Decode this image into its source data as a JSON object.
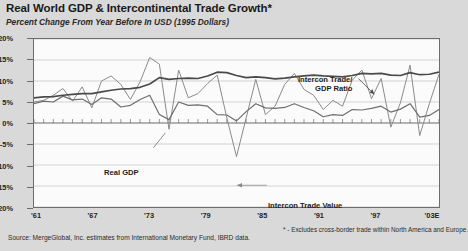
{
  "title": "Real World GDP & Intercontinental Trade Growth*",
  "subtitle": "Percent Change From Year Before In USD (1995 Dollars)",
  "source": "Source:  MergeGlobal, Inc. estimates from International Monetary Fund, IBRD data.",
  "footnote": "* - Excludes cross-border trade within North America and Europe.",
  "annotations": {
    "ratio_line1": "Intercon Trade/",
    "ratio_line2": "GDP Ratio",
    "real_gdp": "Real GDP",
    "trade_value": "Intercon Trade Value"
  },
  "colors": {
    "plot_background": "#fbfbfb",
    "page_background": "#d9d9d9",
    "frame": "#6d6d6d",
    "gridline": "#c9c9c9",
    "zero_line": "#6d6d6d",
    "ratio_series": "#4a4a4a",
    "gdp_series": "#6f6f6f",
    "value_series": "#8a8a8a"
  },
  "chart_data": {
    "type": "line",
    "title": "Real World GDP & Intercontinental Trade Growth*",
    "subtitle": "Percent Change From Year Before In USD (1995 Dollars)",
    "xlabel": "",
    "ylabel": "Percent Change From Year Before In USD (1995 Dollars)",
    "ylim": [
      -20,
      20
    ],
    "yticks": [
      20,
      15,
      10,
      5,
      0,
      -5,
      -10,
      -15,
      -20
    ],
    "ytick_labels": [
      "20%",
      "15%",
      "10%",
      "5%",
      "0%",
      "-5%",
      "-10%",
      "-15%",
      "-20%"
    ],
    "xlim": [
      1961,
      2003
    ],
    "xticks": [
      1961,
      1967,
      1973,
      1979,
      1985,
      1991,
      1997,
      2003
    ],
    "xtick_labels": [
      "'61",
      "'67",
      "'73",
      "'79",
      "'85",
      "'91",
      "'97",
      "'03E"
    ],
    "grid": true,
    "minor_xticks": "annual",
    "legend": "in-plot annotations",
    "x": [
      1961,
      1962,
      1963,
      1964,
      1965,
      1966,
      1967,
      1968,
      1969,
      1970,
      1971,
      1972,
      1973,
      1974,
      1975,
      1976,
      1977,
      1978,
      1979,
      1980,
      1981,
      1982,
      1983,
      1984,
      1985,
      1986,
      1987,
      1988,
      1989,
      1990,
      1991,
      1992,
      1993,
      1994,
      1995,
      1996,
      1997,
      1998,
      1999,
      2000,
      2001,
      2002,
      2003
    ],
    "series": [
      {
        "name": "Intercon Trade/GDP Ratio",
        "units": "percent",
        "values": [
          6.0,
          6.2,
          6.3,
          6.6,
          6.8,
          7.0,
          7.0,
          7.4,
          7.8,
          8.1,
          8.2,
          8.5,
          9.3,
          10.8,
          10.4,
          10.6,
          10.7,
          10.6,
          11.2,
          12.1,
          12.0,
          11.3,
          10.8,
          11.0,
          10.8,
          10.5,
          10.7,
          11.0,
          11.2,
          11.4,
          11.2,
          11.1,
          11.0,
          11.3,
          11.8,
          11.7,
          11.8,
          11.4,
          11.3,
          12.0,
          11.5,
          11.6,
          12.1
        ]
      },
      {
        "name": "Real GDP",
        "units": "percent",
        "values": [
          4.6,
          5.2,
          5.0,
          6.4,
          5.5,
          5.7,
          4.4,
          6.0,
          5.7,
          3.8,
          4.2,
          5.6,
          6.6,
          2.0,
          0.8,
          5.0,
          4.2,
          4.3,
          4.0,
          2.0,
          1.9,
          0.5,
          2.7,
          4.6,
          3.6,
          3.5,
          3.7,
          4.6,
          3.7,
          2.9,
          1.5,
          2.0,
          1.8,
          3.2,
          3.1,
          3.5,
          4.0,
          2.6,
          3.3,
          4.6,
          1.4,
          1.8,
          3.2
        ]
      },
      {
        "name": "Intercon Trade Value",
        "units": "percent",
        "values": [
          5.0,
          5.4,
          6.6,
          8.2,
          5.2,
          8.6,
          3.6,
          10.0,
          11.2,
          9.2,
          5.6,
          9.8,
          15.6,
          14.0,
          -1.5,
          12.6,
          6.0,
          7.0,
          9.4,
          11.4,
          1.2,
          -8.0,
          1.2,
          10.4,
          2.0,
          4.0,
          9.2,
          11.8,
          8.0,
          6.6,
          3.2,
          5.4,
          4.0,
          10.2,
          12.6,
          5.8,
          10.6,
          -1.0,
          4.8,
          13.8,
          -3.0,
          4.6,
          11.6
        ]
      }
    ]
  }
}
